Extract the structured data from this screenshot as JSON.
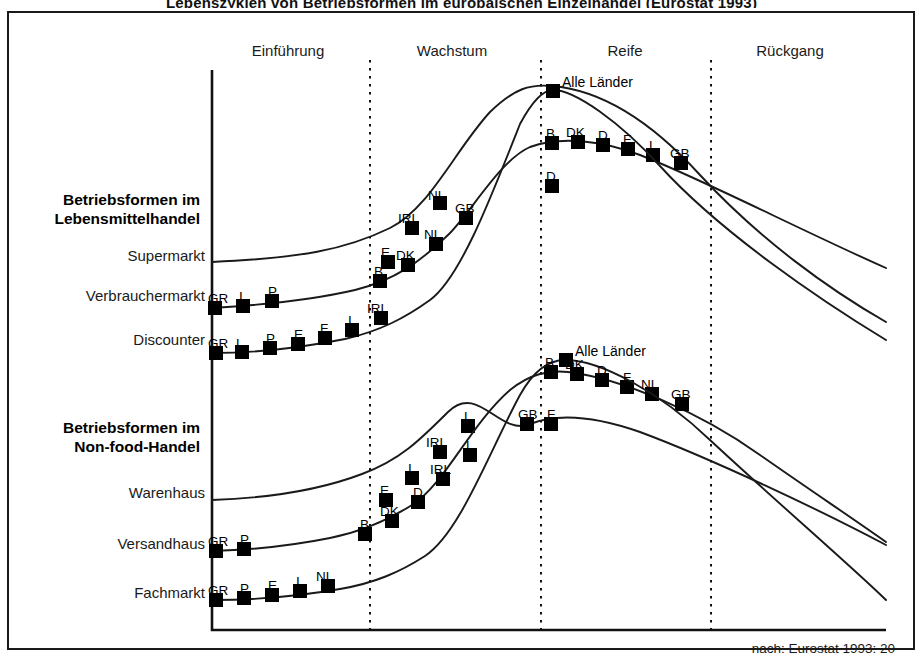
{
  "figure": {
    "clipped_title": "Lebenszyklen von Betriebsformen im europäischen Einzelhandel (Eurostat 1993)",
    "source_note": "nach: Eurostat 1993: 20"
  },
  "phases": [
    {
      "name": "einfuehrung",
      "label": "Einführung",
      "center_x": 288
    },
    {
      "name": "wachstum",
      "label": "Wachstum",
      "center_x": 452
    },
    {
      "name": "reife",
      "label": "Reife",
      "center_x": 625
    },
    {
      "name": "rueckgang",
      "label": "Rückgang",
      "center_x": 790
    }
  ],
  "phase_dividers_x": [
    370,
    541,
    711
  ],
  "axis": {
    "x0": 212,
    "x1": 886,
    "y_top": 70,
    "y_bottom": 630
  },
  "groups": [
    {
      "name": "food",
      "heading_line1": "Betriebsformen im",
      "heading_line2": "Lebensmittelhandel",
      "heading_x": 200,
      "heading_y": 190,
      "rows": [
        {
          "name": "supermarkt",
          "label": "Supermarkt",
          "x": 205,
          "y": 257
        },
        {
          "name": "verbrauchermarkt",
          "label": "Verbrauchermarkt",
          "x": 205,
          "y": 297
        },
        {
          "name": "discounter",
          "label": "Discounter",
          "x": 205,
          "y": 341
        }
      ]
    },
    {
      "name": "nonfood",
      "heading_line1": "Betriebsformen im",
      "heading_line2": "Non-food-Handel",
      "heading_x": 200,
      "heading_y": 418,
      "rows": [
        {
          "name": "warenhaus",
          "label": "Warenhaus",
          "x": 205,
          "y": 494
        },
        {
          "name": "versandhaus",
          "label": "Versandhaus",
          "x": 205,
          "y": 545
        },
        {
          "name": "fachmarkt",
          "label": "Fachmarkt",
          "x": 205,
          "y": 594
        }
      ]
    }
  ],
  "chart_data": {
    "type": "line",
    "title": "Lebenszyklen von Betriebsformen im europäischen Einzelhandel",
    "xlabel": "",
    "ylabel": "",
    "grid": false,
    "legend": "none",
    "x_phase_labels": [
      "Einführung",
      "Wachstum",
      "Reife",
      "Rückgang"
    ],
    "annotations": [
      "Alle Länder",
      "Alle Länder"
    ],
    "series": [
      {
        "name": "Supermarkt",
        "group": "Lebensmittelhandel",
        "path": "M 212,262 C 300,258 345,250 390,228 C 430,208 455,150 490,112 C 515,88 530,84 552,86 C 600,90 650,120 700,175 C 760,240 830,290 886,322",
        "markers": [
          {
            "label": "E",
            "x": 388,
            "y": 262,
            "lx": 381,
            "ly": 246
          },
          {
            "label": "IRL",
            "x": 412,
            "y": 228,
            "lx": 398,
            "ly": 212
          },
          {
            "label": "NL",
            "x": 440,
            "y": 203,
            "lx": 428,
            "ly": 189
          },
          {
            "label": "D",
            "x": 552,
            "y": 186,
            "lx": 546,
            "ly": 170
          }
        ]
      },
      {
        "name": "Verbrauchermarkt",
        "group": "Lebensmittelhandel",
        "path": "M 212,308 C 262,305 312,300 355,290 C 395,280 420,262 448,235 C 470,214 500,160 530,147 C 560,136 600,140 640,155 C 700,178 800,230 886,268",
        "markers": [
          {
            "label": "GR",
            "x": 215,
            "y": 308,
            "lx": 208,
            "ly": 292
          },
          {
            "label": "I",
            "x": 243,
            "y": 306,
            "lx": 239,
            "ly": 290
          },
          {
            "label": "P",
            "x": 272,
            "y": 301,
            "lx": 268,
            "ly": 285
          },
          {
            "label": "B",
            "x": 380,
            "y": 281,
            "lx": 374,
            "ly": 265
          },
          {
            "label": "DK",
            "x": 408,
            "y": 265,
            "lx": 396,
            "ly": 249
          },
          {
            "label": "NL",
            "x": 436,
            "y": 244,
            "lx": 424,
            "ly": 228
          },
          {
            "label": "GB",
            "x": 466,
            "y": 218,
            "lx": 455,
            "ly": 202
          },
          {
            "label": "B",
            "x": 552,
            "y": 143,
            "lx": 546,
            "ly": 127
          },
          {
            "label": "DK",
            "x": 578,
            "y": 142,
            "lx": 566,
            "ly": 126
          },
          {
            "label": "D",
            "x": 603,
            "y": 145,
            "lx": 598,
            "ly": 129
          },
          {
            "label": "F",
            "x": 628,
            "y": 149,
            "lx": 623,
            "ly": 133
          },
          {
            "label": "L",
            "x": 653,
            "y": 155,
            "lx": 649,
            "ly": 139
          },
          {
            "label": "GB",
            "x": 681,
            "y": 163,
            "lx": 670,
            "ly": 147
          }
        ]
      },
      {
        "name": "Discounter",
        "group": "Lebensmittelhandel",
        "path": "M 212,353 C 255,353 300,348 345,339 C 380,331 405,318 430,300 C 460,278 490,200 520,124 C 535,96 545,90 553,90 C 575,90 620,122 660,166 C 720,232 820,300 886,340",
        "markers": [
          {
            "label": "GR",
            "x": 216,
            "y": 353,
            "lx": 208,
            "ly": 337
          },
          {
            "label": "L",
            "x": 242,
            "y": 352,
            "lx": 236,
            "ly": 337
          },
          {
            "label": "P",
            "x": 270,
            "y": 348,
            "lx": 266,
            "ly": 332
          },
          {
            "label": "E",
            "x": 298,
            "y": 344,
            "lx": 294,
            "ly": 328
          },
          {
            "label": "F",
            "x": 325,
            "y": 338,
            "lx": 320,
            "ly": 322
          },
          {
            "label": "I",
            "x": 352,
            "y": 330,
            "lx": 348,
            "ly": 314
          },
          {
            "label": "IRL",
            "x": 381,
            "y": 318,
            "lx": 367,
            "ly": 302
          },
          {
            "label": "Alle Länder",
            "x": 553,
            "y": 91,
            "lx": 562,
            "ly": 75,
            "big": true
          }
        ]
      },
      {
        "name": "Warenhaus",
        "group": "Non-food-Handel",
        "path": "M 212,500 C 270,498 320,490 362,474 C 400,460 420,440 448,412 C 478,382 500,437 530,424 C 560,412 600,418 640,432 C 710,458 820,510 886,545",
        "markers": [
          {
            "label": "E",
            "x": 386,
            "y": 500,
            "lx": 380,
            "ly": 484
          },
          {
            "label": "I",
            "x": 412,
            "y": 478,
            "lx": 408,
            "ly": 462
          },
          {
            "label": "IRL",
            "x": 440,
            "y": 452,
            "lx": 426,
            "ly": 436
          },
          {
            "label": "L",
            "x": 468,
            "y": 426,
            "lx": 464,
            "ly": 410
          },
          {
            "label": "GB",
            "x": 527,
            "y": 424,
            "lx": 518,
            "ly": 408
          },
          {
            "label": "F",
            "x": 551,
            "y": 424,
            "lx": 547,
            "ly": 408
          }
        ]
      },
      {
        "name": "Versandhaus",
        "group": "Non-food-Handel",
        "path": "M 212,551 C 250,550 290,546 330,538 C 360,532 385,522 412,505 C 445,484 470,425 510,390 C 530,374 548,370 568,372 C 620,378 700,412 760,455 C 810,490 855,520 886,542",
        "markers": [
          {
            "label": "GR",
            "x": 216,
            "y": 551,
            "lx": 208,
            "ly": 535
          },
          {
            "label": "P",
            "x": 244,
            "y": 549,
            "lx": 240,
            "ly": 533
          },
          {
            "label": "B",
            "x": 365,
            "y": 534,
            "lx": 360,
            "ly": 518
          },
          {
            "label": "DK",
            "x": 392,
            "y": 521,
            "lx": 380,
            "ly": 505
          },
          {
            "label": "D",
            "x": 418,
            "y": 502,
            "lx": 413,
            "ly": 486
          },
          {
            "label": "IRL",
            "x": 443,
            "y": 479,
            "lx": 430,
            "ly": 463
          },
          {
            "label": "L",
            "x": 470,
            "y": 455,
            "lx": 466,
            "ly": 439
          },
          {
            "label": "B",
            "x": 551,
            "y": 372,
            "lx": 545,
            "ly": 356
          },
          {
            "label": "DK",
            "x": 577,
            "y": 374,
            "lx": 565,
            "ly": 358
          },
          {
            "label": "D",
            "x": 602,
            "y": 380,
            "lx": 597,
            "ly": 364
          },
          {
            "label": "F",
            "x": 627,
            "y": 387,
            "lx": 623,
            "ly": 371
          },
          {
            "label": "NL",
            "x": 652,
            "y": 394,
            "lx": 641,
            "ly": 378
          },
          {
            "label": "GB",
            "x": 682,
            "y": 404,
            "lx": 671,
            "ly": 388
          }
        ]
      },
      {
        "name": "Fachmarkt",
        "group": "Non-food-Handel",
        "path": "M 212,600 C 260,600 300,596 340,589 C 375,583 400,572 425,556 C 460,533 490,450 520,395 C 535,368 550,360 565,360 C 600,360 660,392 710,440 C 780,505 850,565 886,600",
        "markers": [
          {
            "label": "GR",
            "x": 216,
            "y": 600,
            "lx": 208,
            "ly": 584
          },
          {
            "label": "P",
            "x": 244,
            "y": 598,
            "lx": 240,
            "ly": 582
          },
          {
            "label": "E",
            "x": 272,
            "y": 595,
            "lx": 268,
            "ly": 579
          },
          {
            "label": "I",
            "x": 300,
            "y": 591,
            "lx": 296,
            "ly": 575
          },
          {
            "label": "NL",
            "x": 328,
            "y": 586,
            "lx": 316,
            "ly": 570
          },
          {
            "label": "Alle Länder",
            "x": 566,
            "y": 360,
            "lx": 575,
            "ly": 344,
            "big": true
          }
        ]
      }
    ]
  }
}
